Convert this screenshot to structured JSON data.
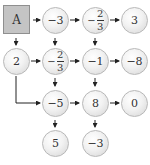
{
  "start": {
    "label": "A"
  },
  "nodes": {
    "r1c2": {
      "text": "−3"
    },
    "r1c3": {
      "sign": "−",
      "num": "2",
      "den": "3"
    },
    "r1c4": {
      "text": "3"
    },
    "r2c1": {
      "text": "2"
    },
    "r2c2": {
      "sign": "−",
      "num": "2",
      "den": "3"
    },
    "r2c3": {
      "text": "−1"
    },
    "r2c4": {
      "text": "−8"
    },
    "r3c2": {
      "text": "−5"
    },
    "r3c3": {
      "text": "8"
    },
    "r3c4": {
      "text": "0"
    },
    "r4c2": {
      "text": "5"
    },
    "r4c3": {
      "text": "−3"
    }
  },
  "colors": {
    "box_fill": "#c4c4c4",
    "arrow": "#222222"
  }
}
